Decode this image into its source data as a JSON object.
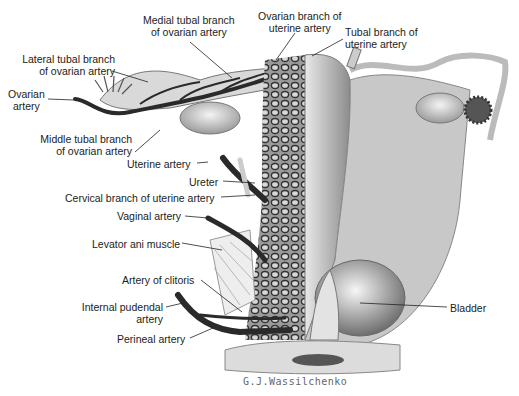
{
  "figure": {
    "type": "anatomical illustration",
    "signature": "G.J.Wassilchenko",
    "labels": {
      "medial_tubal_1": "Medial tubal branch",
      "medial_tubal_2": "of ovarian artery",
      "ovarian_branch_1": "Ovarian branch of",
      "ovarian_branch_2": "uterine artery",
      "tubal_branch_1": "Tubal branch of",
      "tubal_branch_2": "uterine artery",
      "lateral_tubal_1": "Lateral tubal branch",
      "lateral_tubal_2": "of ovarian artery",
      "ovarian_artery_1": "Ovarian",
      "ovarian_artery_2": "artery",
      "middle_tubal_1": "Middle tubal branch",
      "middle_tubal_2": "of ovarian artery",
      "uterine_artery": "Uterine artery",
      "ureter": "Ureter",
      "cervical_branch": "Cervical branch of uterine artery",
      "vaginal_artery": "Vaginal artery",
      "levator_ani": "Levator ani muscle",
      "artery_clitoris": "Artery of clitoris",
      "internal_pudendal_1": "Internal pudendal",
      "internal_pudendal_2": "artery",
      "perineal_artery": "Perineal artery",
      "bladder": "Bladder"
    }
  }
}
